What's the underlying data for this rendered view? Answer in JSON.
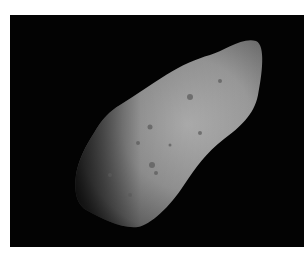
{
  "image": {
    "subject": "asteroid",
    "background_color": "#030303",
    "border_color": "#ffffff"
  }
}
